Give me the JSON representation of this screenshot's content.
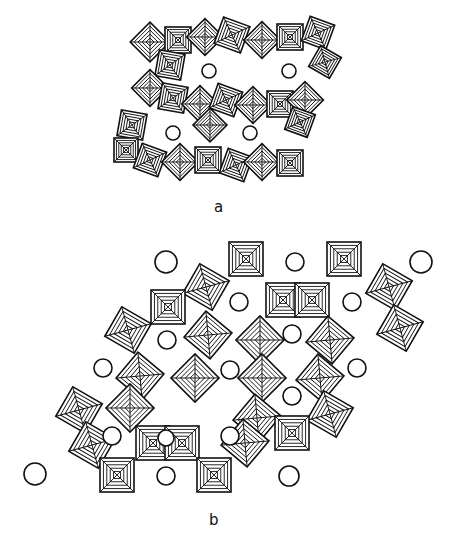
{
  "figure": {
    "panels": [
      {
        "id": "a",
        "label": "a",
        "description": "Framework of corner-sharing octahedra forming four rings, each enclosing a cation (circle)",
        "circles": [
          [
            209,
            71,
            7
          ],
          [
            289,
            71,
            7
          ],
          [
            173,
            133,
            7
          ],
          [
            250,
            133,
            7
          ]
        ],
        "octahedra": [
          [
            150,
            42,
            14,
            45
          ],
          [
            178,
            40,
            13,
            0
          ],
          [
            205,
            37,
            13,
            45
          ],
          [
            232,
            35,
            14,
            20
          ],
          [
            262,
            40,
            13,
            45
          ],
          [
            290,
            37,
            13,
            0
          ],
          [
            318,
            33,
            13,
            20
          ],
          [
            170,
            65,
            13,
            10
          ],
          [
            325,
            62,
            12,
            30
          ],
          [
            150,
            88,
            13,
            45
          ],
          [
            173,
            98,
            13,
            10
          ],
          [
            200,
            104,
            13,
            45
          ],
          [
            226,
            100,
            13,
            20
          ],
          [
            253,
            105,
            13,
            45
          ],
          [
            280,
            104,
            13,
            0
          ],
          [
            305,
            100,
            13,
            45
          ],
          [
            132,
            125,
            13,
            10
          ],
          [
            210,
            125,
            12,
            45
          ],
          [
            300,
            122,
            12,
            20
          ],
          [
            126,
            150,
            12,
            0
          ],
          [
            150,
            160,
            13,
            20
          ],
          [
            180,
            162,
            13,
            45
          ],
          [
            208,
            160,
            13,
            0
          ],
          [
            236,
            165,
            13,
            20
          ],
          [
            262,
            162,
            13,
            45
          ],
          [
            290,
            163,
            13,
            0
          ]
        ]
      },
      {
        "id": "b",
        "label": "b",
        "description": "Expanded polyhedral framework with square and tilted octahedra around triangular and hexagonal channels containing cations",
        "circles": [
          [
            166,
            262,
            11
          ],
          [
            295,
            262,
            9
          ],
          [
            421,
            262,
            11
          ],
          [
            239,
            302,
            9
          ],
          [
            352,
            302,
            9
          ],
          [
            167,
            340,
            9
          ],
          [
            292,
            334,
            9
          ],
          [
            103,
            368,
            9
          ],
          [
            230,
            370,
            9
          ],
          [
            357,
            368,
            9
          ],
          [
            292,
            396,
            9
          ],
          [
            112,
            436,
            9
          ],
          [
            166,
            438,
            8
          ],
          [
            230,
            436,
            9
          ],
          [
            35,
            474,
            11
          ],
          [
            166,
            476,
            9
          ],
          [
            289,
            476,
            10
          ]
        ],
        "octahedra": [
          [
            246,
            259,
            17,
            0
          ],
          [
            344,
            259,
            17,
            0
          ],
          [
            206,
            287,
            17,
            30
          ],
          [
            389,
            287,
            17,
            30
          ],
          [
            168,
            307,
            17,
            0
          ],
          [
            283,
            300,
            17,
            0
          ],
          [
            312,
            300,
            17,
            0
          ],
          [
            128,
            330,
            17,
            30
          ],
          [
            208,
            335,
            17,
            40
          ],
          [
            260,
            340,
            17,
            45
          ],
          [
            330,
            340,
            17,
            40
          ],
          [
            400,
            328,
            17,
            30
          ],
          [
            140,
            376,
            17,
            40
          ],
          [
            195,
            378,
            17,
            45
          ],
          [
            262,
            378,
            17,
            45
          ],
          [
            320,
            378,
            17,
            40
          ],
          [
            79,
            410,
            17,
            30
          ],
          [
            130,
            408,
            17,
            45
          ],
          [
            257,
            418,
            17,
            40
          ],
          [
            330,
            414,
            17,
            30
          ],
          [
            92,
            445,
            17,
            30
          ],
          [
            153,
            443,
            17,
            0
          ],
          [
            182,
            443,
            17,
            0
          ],
          [
            245,
            443,
            17,
            40
          ],
          [
            292,
            433,
            17,
            0
          ],
          [
            117,
            475,
            17,
            0
          ],
          [
            214,
            475,
            17,
            0
          ]
        ]
      }
    ]
  },
  "labels": {
    "a": "a",
    "b": "b"
  }
}
